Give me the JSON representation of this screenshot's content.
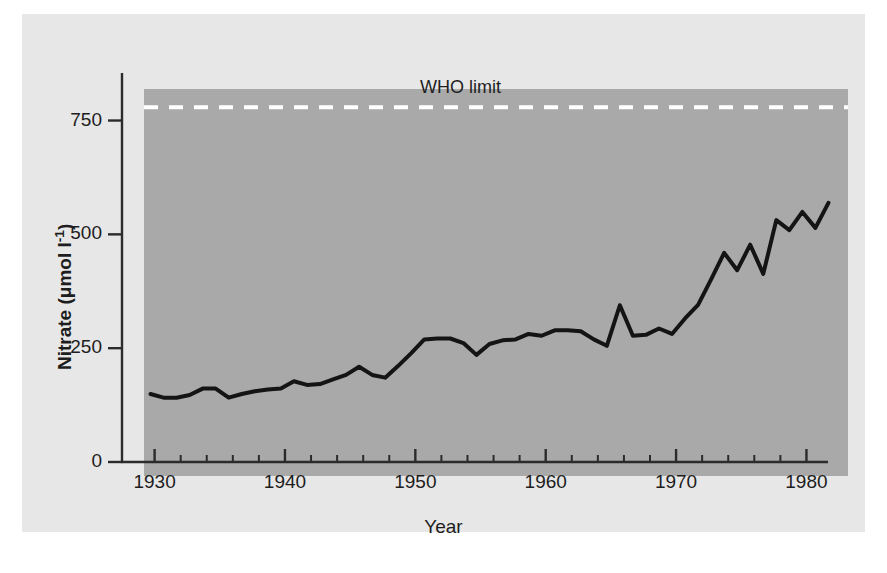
{
  "chart_data": {
    "type": "line",
    "title": "",
    "xlabel": "Year",
    "ylabel": "Nitrate (μmol l⁻¹)",
    "ylabel_text": "Nitrate (",
    "ylabel_unit": "μmol l",
    "ylabel_exp": "-1",
    "ylabel_close": ")",
    "xlim": [
      1927.5,
      1981.5
    ],
    "ylim": [
      0,
      850
    ],
    "grid": false,
    "legend": "none",
    "background_color": "#a9a9a9",
    "line_color": "#141414",
    "xticks": [
      1930,
      1940,
      1950,
      1960,
      1970,
      1980
    ],
    "xtick_labels": [
      "1930",
      "1940",
      "1950",
      "1960",
      "1970",
      "1980"
    ],
    "xminor_tick_interval": 2,
    "yticks": [
      0,
      250,
      500,
      750
    ],
    "ytick_labels": [
      "0",
      "250",
      "500",
      "750"
    ],
    "annotations": [
      {
        "name": "who-limit",
        "label": "WHO limit",
        "type": "hline",
        "value": 810,
        "style": "dashed",
        "color": "#ffffff"
      }
    ],
    "series": [
      {
        "name": "Nitrate concentration",
        "x": [
          1928,
          1929,
          1930,
          1931,
          1932,
          1933,
          1934,
          1935,
          1936,
          1937,
          1938,
          1939,
          1940,
          1941,
          1942,
          1943,
          1944,
          1945,
          1946,
          1947,
          1948,
          1949,
          1950,
          1951,
          1952,
          1953,
          1954,
          1955,
          1956,
          1957,
          1958,
          1959,
          1960,
          1961,
          1962,
          1963,
          1964,
          1965,
          1966,
          1967,
          1968,
          1969,
          1970,
          1971,
          1972,
          1973,
          1974,
          1975,
          1976,
          1977,
          1978,
          1979,
          1980
        ],
        "values": [
          180,
          172,
          172,
          178,
          192,
          192,
          172,
          180,
          186,
          190,
          192,
          208,
          200,
          202,
          212,
          222,
          240,
          222,
          216,
          242,
          270,
          300,
          302,
          302,
          292,
          266,
          290,
          298,
          300,
          312,
          308,
          320,
          320,
          318,
          300,
          286,
          375,
          308,
          310,
          324,
          312,
          346,
          376,
          432,
          490,
          452,
          508,
          444,
          562,
          540,
          580,
          545,
          600
        ]
      }
    ]
  },
  "geometry": {
    "plot_left": 122,
    "plot_top": 75,
    "plot_width": 704,
    "plot_height": 387,
    "x_1930_px": 51,
    "px_per_year": 12.58,
    "y_zero_px": 353,
    "px_per_unit": 0.3933
  }
}
